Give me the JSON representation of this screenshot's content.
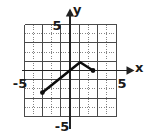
{
  "figure": {
    "background_color": "#ffffff",
    "width": 147,
    "height": 137
  },
  "axes": {
    "x_label": "x",
    "y_label": "y",
    "x_tick_negative": "-5",
    "x_tick_positive": "5",
    "y_tick_positive": "5",
    "y_tick_negative": "-5",
    "axis_color": "#222222",
    "grid_major_color": "#4a4a4a",
    "grid_minor_color": "#777777",
    "curve_color": "#0d0d0d"
  },
  "chart_data": {
    "type": "line",
    "title": "",
    "subtitle": "",
    "xlabel": "x",
    "ylabel": "y",
    "xlim": [
      -5,
      5
    ],
    "ylim": [
      -5,
      5
    ],
    "xticks": [
      -5,
      5
    ],
    "yticks": [
      -5,
      5
    ],
    "xtick_labels": [
      "-5",
      "5"
    ],
    "ytick_labels": [
      "-5",
      "5"
    ],
    "grid": true,
    "grid_major_step": 2,
    "grid_minor_step": 1,
    "legend": null,
    "legend_position": "none",
    "annotations": [],
    "series": [
      {
        "name": "piecewise-linear-graph",
        "color": "#0d0d0d",
        "line_width": 2.6,
        "endpoint_markers": [
          "dot",
          "dot"
        ],
        "points": [
          {
            "x": -3,
            "y": -2.4
          },
          {
            "x": 1.1,
            "y": 0.9
          },
          {
            "x": 2.5,
            "y": 0.0
          }
        ],
        "segments": [
          {
            "from": {
              "x": -3,
              "y": -2.4
            },
            "to": {
              "x": 1.1,
              "y": 0.9
            },
            "slope": "increasing"
          },
          {
            "from": {
              "x": 1.1,
              "y": 0.9
            },
            "to": {
              "x": 2.5,
              "y": 0.0
            },
            "slope": "decreasing"
          }
        ]
      }
    ]
  },
  "geometry": {
    "origin_px": {
      "x": 70,
      "y": 70.5
    },
    "unit_px": 9.2,
    "grid_left_px": 24.5,
    "grid_right_px": 116.5,
    "grid_top_px": 24.5,
    "grid_bottom_px": 116.5
  }
}
